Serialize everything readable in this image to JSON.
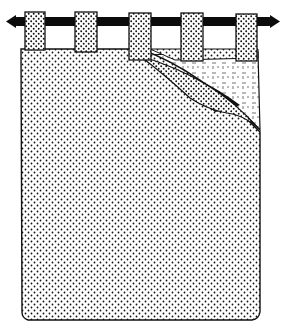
{
  "illustration": {
    "subject": "tab-top curtain on rod",
    "tab_count": 5,
    "colors": {
      "background": "#ffffff",
      "ink": "#111111",
      "rod": "#0c0c0c"
    }
  }
}
